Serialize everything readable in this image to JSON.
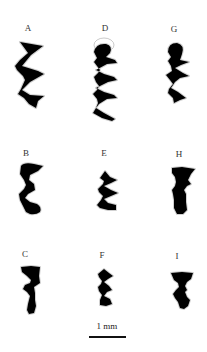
{
  "figure": {
    "panels": [
      {
        "id": "A",
        "label": "A"
      },
      {
        "id": "D",
        "label": "D"
      },
      {
        "id": "G",
        "label": "G"
      },
      {
        "id": "B",
        "label": "B"
      },
      {
        "id": "E",
        "label": "E"
      },
      {
        "id": "H",
        "label": "H"
      },
      {
        "id": "C",
        "label": "C"
      },
      {
        "id": "F",
        "label": "F"
      },
      {
        "id": "I",
        "label": "I"
      }
    ],
    "scale_bar": {
      "label": "1 mm"
    },
    "colors": {
      "shape_fill": "#000000",
      "outline": "#c8c8c8",
      "background": "#ffffff"
    }
  }
}
